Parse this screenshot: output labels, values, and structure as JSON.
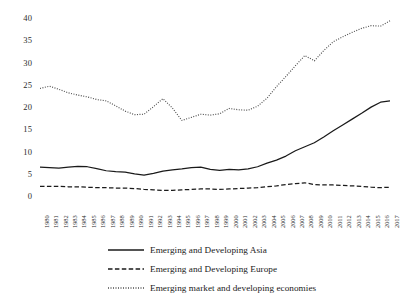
{
  "chart_data": {
    "type": "line",
    "title": "",
    "subtitle": "",
    "xlabel": "",
    "ylabel": "",
    "grid": false,
    "legend_position": "bottom",
    "xlim": [
      1980,
      2017
    ],
    "ylim": [
      0,
      40
    ],
    "yticks": [
      0,
      5,
      10,
      15,
      20,
      25,
      30,
      35,
      40
    ],
    "x": [
      1980,
      1981,
      1982,
      1983,
      1984,
      1985,
      1986,
      1987,
      1988,
      1989,
      1990,
      1991,
      1992,
      1993,
      1994,
      1995,
      1996,
      1997,
      1998,
      1999,
      2000,
      2001,
      2002,
      2003,
      2004,
      2005,
      2006,
      2007,
      2008,
      2009,
      2010,
      2011,
      2012,
      2013,
      2014,
      2015,
      2016,
      2017
    ],
    "categories": [
      "1980",
      "1981",
      "1982",
      "1983",
      "1984",
      "1985",
      "1986",
      "1987",
      "1988",
      "1989",
      "1990",
      "1991",
      "1992",
      "1993",
      "1994",
      "1995",
      "1996",
      "1997",
      "1998",
      "1999",
      "2000",
      "2001",
      "2002",
      "2003",
      "2004",
      "2005",
      "2006",
      "2007",
      "2008",
      "2009",
      "2010",
      "2011",
      "2012",
      "2013",
      "2014",
      "2015",
      "2016",
      "2017"
    ],
    "series": [
      {
        "name": "Emerging and Developing Asia",
        "style": "solid",
        "color": "#1a1a1a",
        "values": [
          6.7,
          6.6,
          6.5,
          6.7,
          6.9,
          6.8,
          6.4,
          5.9,
          5.7,
          5.6,
          5.2,
          4.9,
          5.3,
          5.8,
          6.1,
          6.3,
          6.6,
          6.7,
          6.2,
          6.0,
          6.2,
          6.1,
          6.3,
          6.8,
          7.6,
          8.3,
          9.2,
          10.4,
          11.3,
          12.2,
          13.5,
          14.9,
          16.2,
          17.5,
          18.8,
          20.2,
          21.3,
          21.6
        ]
      },
      {
        "name": "Emerging and Developing Europe",
        "style": "dashed",
        "color": "#1a1a1a",
        "values": [
          2.4,
          2.4,
          2.4,
          2.3,
          2.3,
          2.2,
          2.1,
          2.1,
          2.0,
          2.0,
          1.9,
          1.7,
          1.6,
          1.5,
          1.5,
          1.6,
          1.7,
          1.8,
          1.8,
          1.7,
          1.8,
          1.9,
          2.0,
          2.1,
          2.3,
          2.5,
          2.8,
          3.0,
          3.2,
          2.8,
          2.7,
          2.7,
          2.6,
          2.5,
          2.4,
          2.2,
          2.1,
          2.2
        ]
      },
      {
        "name": "Emerging market and developing economies",
        "style": "dotted",
        "color": "#4d4d4d",
        "values": [
          24.4,
          24.9,
          24.2,
          23.4,
          22.9,
          22.5,
          21.9,
          21.6,
          20.5,
          19.3,
          18.5,
          18.6,
          20.3,
          22.1,
          20.0,
          17.2,
          17.9,
          18.6,
          18.4,
          18.7,
          19.9,
          19.6,
          19.5,
          20.4,
          22.2,
          24.8,
          27.1,
          29.5,
          31.8,
          30.6,
          32.9,
          34.9,
          36.0,
          37.0,
          37.9,
          38.5,
          38.4,
          39.6
        ]
      }
    ]
  },
  "legend": {
    "items": [
      {
        "label": "Emerging and Developing Asia",
        "style": "solid"
      },
      {
        "label": "Emerging and Developing Europe",
        "style": "dashed"
      },
      {
        "label": "Emerging market and developing economies",
        "style": "dotted"
      }
    ]
  }
}
